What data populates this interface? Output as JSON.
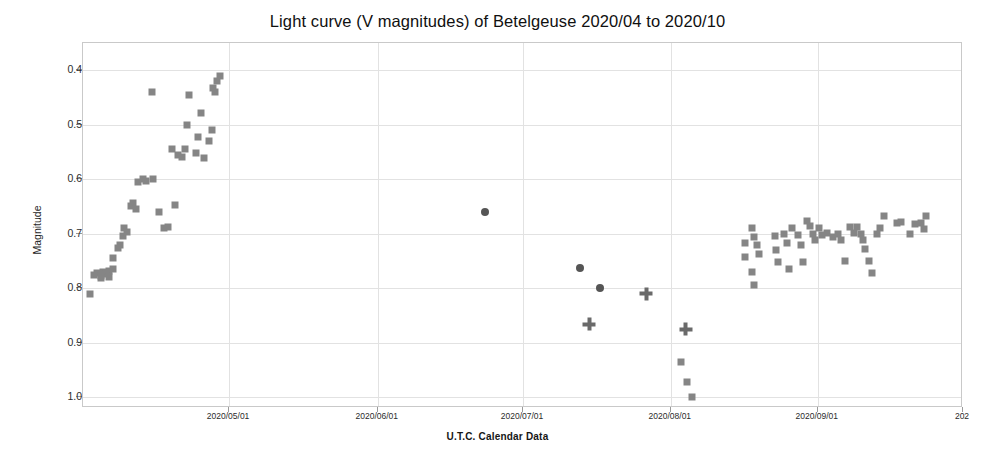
{
  "chart_data": {
    "type": "scatter",
    "title": "Light curve (V magnitudes) of Betelgeuse 2020/04 to 2020/10",
    "xlabel": "U.T.C. Calendar Data",
    "ylabel": "Magnitude",
    "grid": true,
    "legend": "none",
    "y_inverted": true,
    "ylim": [
      0.35,
      1.02
    ],
    "yticks": [
      "0.4",
      "0.5",
      "0.6",
      "0.7",
      "0.8",
      "0.9",
      "1.0"
    ],
    "ytick_values": [
      0.4,
      0.5,
      0.6,
      0.7,
      0.8,
      0.9,
      1.0
    ],
    "xticks": [
      "2020/05/01",
      "2020/06/01",
      "2020/07/01",
      "2020/08/01",
      "2020/09/01",
      "202"
    ],
    "xtick_positions_frac": [
      0.166,
      0.335,
      0.5,
      0.668,
      0.835,
      1.0
    ],
    "xlim": [
      "2020/04/06",
      "2020/10/01"
    ],
    "series": [
      {
        "name": "square-markers",
        "marker": "square",
        "color": "#858585",
        "points": [
          [
            0.008,
            0.81
          ],
          [
            0.012,
            0.775
          ],
          [
            0.016,
            0.772
          ],
          [
            0.02,
            0.777
          ],
          [
            0.023,
            0.77
          ],
          [
            0.026,
            0.774
          ],
          [
            0.029,
            0.768
          ],
          [
            0.02,
            0.782
          ],
          [
            0.03,
            0.78
          ],
          [
            0.034,
            0.765
          ],
          [
            0.034,
            0.745
          ],
          [
            0.04,
            0.727
          ],
          [
            0.042,
            0.72
          ],
          [
            0.046,
            0.705
          ],
          [
            0.047,
            0.69
          ],
          [
            0.05,
            0.697
          ],
          [
            0.054,
            0.65
          ],
          [
            0.057,
            0.643
          ],
          [
            0.06,
            0.655
          ],
          [
            0.063,
            0.605
          ],
          [
            0.068,
            0.6
          ],
          [
            0.072,
            0.603
          ],
          [
            0.079,
            0.6
          ],
          [
            0.086,
            0.66
          ],
          [
            0.092,
            0.69
          ],
          [
            0.097,
            0.688
          ],
          [
            0.104,
            0.648
          ],
          [
            0.101,
            0.545
          ],
          [
            0.108,
            0.555
          ],
          [
            0.112,
            0.56
          ],
          [
            0.116,
            0.545
          ],
          [
            0.118,
            0.5
          ],
          [
            0.12,
            0.445
          ],
          [
            0.128,
            0.552
          ],
          [
            0.131,
            0.522
          ],
          [
            0.134,
            0.478
          ],
          [
            0.138,
            0.562
          ],
          [
            0.143,
            0.53
          ],
          [
            0.147,
            0.51
          ],
          [
            0.15,
            0.44
          ],
          [
            0.152,
            0.42
          ],
          [
            0.156,
            0.41
          ],
          [
            0.148,
            0.432
          ],
          [
            0.078,
            0.44
          ],
          [
            0.68,
            0.935
          ],
          [
            0.686,
            0.972
          ],
          [
            0.692,
            1.0
          ],
          [
            0.752,
            0.718
          ],
          [
            0.752,
            0.742
          ],
          [
            0.76,
            0.69
          ],
          [
            0.762,
            0.706
          ],
          [
            0.766,
            0.72
          ],
          [
            0.768,
            0.738
          ],
          [
            0.76,
            0.77
          ],
          [
            0.763,
            0.795
          ],
          [
            0.786,
            0.705
          ],
          [
            0.788,
            0.73
          ],
          [
            0.79,
            0.752
          ],
          [
            0.797,
            0.7
          ],
          [
            0.8,
            0.718
          ],
          [
            0.802,
            0.765
          ],
          [
            0.806,
            0.69
          ],
          [
            0.812,
            0.702
          ],
          [
            0.816,
            0.72
          ],
          [
            0.818,
            0.752
          ],
          [
            0.823,
            0.676
          ],
          [
            0.826,
            0.686
          ],
          [
            0.829,
            0.7
          ],
          [
            0.832,
            0.712
          ],
          [
            0.836,
            0.69
          ],
          [
            0.84,
            0.702
          ],
          [
            0.846,
            0.698
          ],
          [
            0.852,
            0.706
          ],
          [
            0.858,
            0.7
          ],
          [
            0.861,
            0.712
          ],
          [
            0.866,
            0.75
          ],
          [
            0.872,
            0.688
          ],
          [
            0.876,
            0.698
          ],
          [
            0.88,
            0.688
          ],
          [
            0.884,
            0.7
          ],
          [
            0.886,
            0.712
          ],
          [
            0.889,
            0.728
          ],
          [
            0.893,
            0.75
          ],
          [
            0.897,
            0.772
          ],
          [
            0.902,
            0.7
          ],
          [
            0.906,
            0.69
          ],
          [
            0.91,
            0.668
          ],
          [
            0.925,
            0.68
          ],
          [
            0.93,
            0.678
          ],
          [
            0.94,
            0.7
          ],
          [
            0.946,
            0.682
          ],
          [
            0.952,
            0.68
          ],
          [
            0.956,
            0.692
          ],
          [
            0.958,
            0.668
          ]
        ]
      },
      {
        "name": "circle-markers",
        "marker": "circle",
        "color": "#555555",
        "points": [
          [
            0.457,
            0.66
          ],
          [
            0.565,
            0.763
          ],
          [
            0.588,
            0.8
          ]
        ]
      },
      {
        "name": "cross-markers",
        "marker": "cross",
        "color": "#6a6a6a",
        "points": [
          [
            0.575,
            0.866
          ],
          [
            0.64,
            0.81
          ],
          [
            0.685,
            0.875
          ]
        ]
      }
    ]
  }
}
